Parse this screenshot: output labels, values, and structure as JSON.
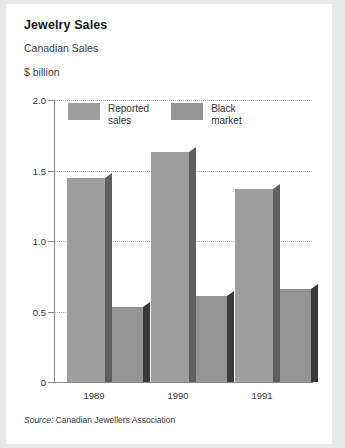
{
  "card": {
    "title": "Jewelry Sales",
    "subtitle": "Canadian Sales",
    "unit_label": "$ billion",
    "source_prefix": "Source:",
    "source_text": " Canadian Jewellers Association"
  },
  "colors": {
    "page_background": "#e8e8e8",
    "card_background": "#ffffff",
    "reported_face": "#9e9e9e",
    "reported_side": "#5e5e5e",
    "black_market_face": "#949494",
    "black_market_side": "#3a3a3a",
    "axis": "#8a8a8a",
    "gridline": "#b4b4b4",
    "text": "#333333",
    "title_text": "#1a1a1a"
  },
  "chart_data": {
    "type": "bar",
    "title": "Jewelry Sales",
    "subtitle": "Canadian Sales",
    "xlabel": "",
    "ylabel": "$ billion",
    "ylim": [
      0,
      2.0
    ],
    "yticks": [
      "0",
      "0.5",
      "1.0",
      "1.5",
      "2.0"
    ],
    "ytick_values": [
      0,
      0.5,
      1.0,
      1.5,
      2.0
    ],
    "grid": true,
    "legend_position": "top-left-inside",
    "categories": [
      "1989",
      "1990",
      "1991"
    ],
    "series": [
      {
        "name": "Reported sales",
        "legend_label": "Reported\nsales",
        "values": [
          1.45,
          1.63,
          1.37
        ]
      },
      {
        "name": "Black market",
        "legend_label": "Black\nmarket",
        "values": [
          0.53,
          0.61,
          0.66
        ]
      }
    ],
    "source": "Source: Canadian Jewellers Association"
  }
}
